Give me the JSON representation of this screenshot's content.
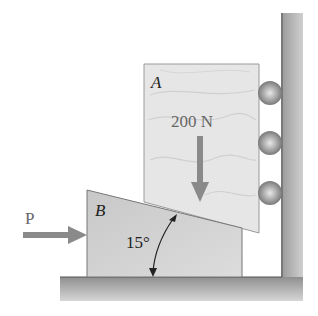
{
  "figure": {
    "block_a": {
      "label": "A"
    },
    "block_b": {
      "label": "B"
    },
    "load": {
      "label": "200 N"
    },
    "force_p": {
      "label": "P"
    },
    "angle": {
      "label": "15°"
    },
    "rollers_count": 3
  },
  "colors": {
    "wall_floor": "#9a9a9a",
    "block_a": "#e4e4e4",
    "wedge_b": "#cfcfcf",
    "arrow": "#8a8a8a",
    "roller": "#8c8c8c"
  }
}
